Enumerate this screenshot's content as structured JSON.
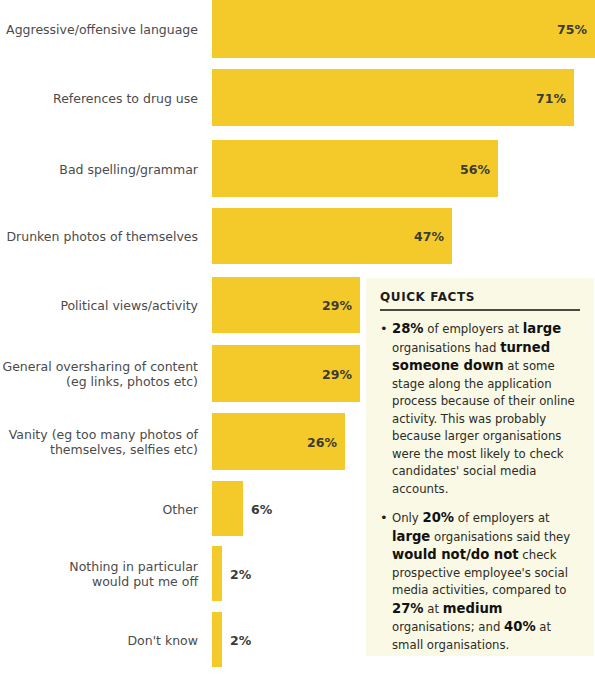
{
  "chart_data": {
    "type": "bar",
    "orientation": "horizontal",
    "title": "",
    "xlabel": "",
    "ylabel": "",
    "xlim": [
      0,
      75
    ],
    "grid": false,
    "legend": false,
    "value_suffix": "%",
    "bar_color": "#F4CA2B",
    "categories": [
      "Aggressive/offensive language",
      "References to drug use",
      "Bad spelling/grammar",
      "Drunken photos of themselves",
      "Political views/activity",
      "General oversharing of content\n(eg links, photos etc)",
      "Vanity (eg too many photos of\nthemselves, selfies etc)",
      "Other",
      "Nothing in particular\nwould put me off",
      "Don't know"
    ],
    "values": [
      75,
      71,
      56,
      47,
      29,
      29,
      26,
      6,
      2,
      2
    ],
    "value_labels": [
      "75%",
      "71%",
      "56%",
      "47%",
      "29%",
      "29%",
      "26%",
      "6%",
      "2%",
      "2%"
    ]
  },
  "quick_facts": {
    "title": "QUICK FACTS",
    "bullet_glyph": "•",
    "facts": [
      {
        "id": "fact-turned-down",
        "segments": [
          {
            "text": "28%",
            "bold": true
          },
          {
            "text": " of employers at ",
            "bold": false
          },
          {
            "text": "large",
            "bold": true
          },
          {
            "text": " organisations had ",
            "bold": false
          },
          {
            "text": "turned someone down",
            "bold": true
          },
          {
            "text": " at some stage along the application process because of their online activity. This was probably because larger organisations were the most likely to check candidates' social media accounts.",
            "bold": false
          }
        ]
      },
      {
        "id": "fact-would-not-check",
        "segments": [
          {
            "text": "Only ",
            "bold": false
          },
          {
            "text": "20%",
            "bold": true
          },
          {
            "text": " of employers at ",
            "bold": false
          },
          {
            "text": "large",
            "bold": true
          },
          {
            "text": " organisations said they ",
            "bold": false
          },
          {
            "text": "would not/do not",
            "bold": true
          },
          {
            "text": " check prospective employee's social media activities, compared to ",
            "bold": false
          },
          {
            "text": "27%",
            "bold": true
          },
          {
            "text": " at ",
            "bold": false
          },
          {
            "text": "medium",
            "bold": true
          },
          {
            "text": " organisations; and ",
            "bold": false
          },
          {
            "text": "40%",
            "bold": true
          },
          {
            "text": " at small organisations.",
            "bold": false
          }
        ]
      }
    ]
  },
  "layout": {
    "bar_origin_x": 212,
    "px_per_percent": 5.1,
    "rows": [
      {
        "top": 0,
        "height": 58
      },
      {
        "top": 69,
        "height": 57
      },
      {
        "top": 140,
        "height": 57
      },
      {
        "top": 208,
        "height": 56
      },
      {
        "top": 277,
        "height": 56
      },
      {
        "top": 345,
        "height": 57
      },
      {
        "top": 413,
        "height": 57
      },
      {
        "top": 481,
        "height": 55
      },
      {
        "top": 546,
        "height": 55
      },
      {
        "top": 612,
        "height": 55
      }
    ]
  }
}
